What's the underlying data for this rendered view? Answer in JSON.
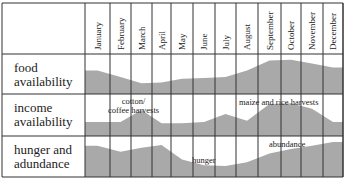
{
  "chart_data": {
    "type": "area",
    "title": "",
    "months": [
      "January",
      "February",
      "March",
      "April",
      "May",
      "June",
      "July",
      "August",
      "September",
      "October",
      "November",
      "December"
    ],
    "rows": [
      {
        "label_line1": "food",
        "label_line2": "availability",
        "description": "Relative food availability across the year (shaded area height)",
        "values": [
          0.62,
          0.45,
          0.28,
          0.3,
          0.4,
          0.42,
          0.45,
          0.62,
          0.88,
          0.9,
          0.8,
          0.7
        ],
        "annotations": []
      },
      {
        "label_line1": "income",
        "label_line2": "availability",
        "description": "Relative income availability across the year (shaded area height)",
        "values": [
          0.35,
          0.35,
          0.65,
          0.32,
          0.32,
          0.35,
          0.55,
          0.38,
          0.8,
          0.82,
          0.68,
          0.35
        ],
        "annotations": [
          {
            "text_line1": "cotton/",
            "text_line2": "coffee harvests",
            "near_month": "March"
          },
          {
            "text_line1": "maize and rice harvests",
            "text_line2": "",
            "near_month": "September"
          }
        ]
      },
      {
        "label_line1": "hunger and",
        "label_line2": "adundance",
        "description": "Hunger (low) vs abundance (high) across the year (shaded area height)",
        "values": [
          0.8,
          0.65,
          0.75,
          0.82,
          0.45,
          0.3,
          0.28,
          0.38,
          0.6,
          0.72,
          0.8,
          0.9
        ],
        "annotations": [
          {
            "text_line1": "hunger",
            "text_line2": "",
            "near_month": "June"
          },
          {
            "text_line1": "abundance",
            "text_line2": "",
            "near_month": "October"
          }
        ]
      }
    ],
    "colors": {
      "fill": "#a9a9a9",
      "grid": "#333333",
      "background": "#ffffff"
    },
    "grid": true,
    "legend": "none"
  },
  "header": {
    "months": [
      "January",
      "February",
      "March",
      "April",
      "May",
      "June",
      "July",
      "August",
      "September",
      "October",
      "November",
      "December"
    ]
  },
  "rows": [
    {
      "label_line1": "food",
      "label_line2": "availability"
    },
    {
      "label_line1": "income",
      "label_line2": "availability"
    },
    {
      "label_line1": "hunger and",
      "label_line2": "adundance"
    }
  ],
  "annotations": {
    "cotton_line1": "cotton/",
    "cotton_line2": "coffee harvests",
    "maize": "maize and rice harvests",
    "hunger": "hunger",
    "abundance": "abundance"
  }
}
